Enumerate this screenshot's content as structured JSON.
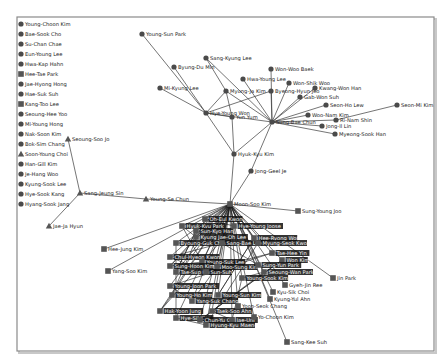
{
  "diagram": {
    "type": "social-network-graph",
    "frame": {
      "x": 17,
      "y": 17,
      "w": 417,
      "h": 334
    }
  },
  "isolated_nodes": [
    {
      "label": "Young-Choon Kim",
      "shape": "circle",
      "x": 21,
      "y": 24
    },
    {
      "label": "Bae-Sook Cho",
      "shape": "circle",
      "x": 21,
      "y": 34
    },
    {
      "label": "Su-Chan Chae",
      "shape": "circle",
      "x": 21,
      "y": 44
    },
    {
      "label": "Eun-Young Lee",
      "shape": "circle",
      "x": 21,
      "y": 54
    },
    {
      "label": "Hwa-Kap Hahn",
      "shape": "circle",
      "x": 21,
      "y": 64
    },
    {
      "label": "Hee-Tae Park",
      "shape": "square",
      "x": 21,
      "y": 74
    },
    {
      "label": "Jae-Hyong Hong",
      "shape": "circle",
      "x": 21,
      "y": 84
    },
    {
      "label": "Hae-Suk Suh",
      "shape": "circle",
      "x": 21,
      "y": 94
    },
    {
      "label": "Kang-Too Lee",
      "shape": "square",
      "x": 21,
      "y": 104
    },
    {
      "label": "Seoung-Hee Yoo",
      "shape": "circle",
      "x": 21,
      "y": 114
    },
    {
      "label": "Mi-Young Hong",
      "shape": "circle",
      "x": 21,
      "y": 124
    },
    {
      "label": "Nak-Soon Kim",
      "shape": "circle",
      "x": 21,
      "y": 134
    },
    {
      "label": "Bok-Sim Chang",
      "shape": "circle",
      "x": 21,
      "y": 144
    },
    {
      "label": "Soon-Young Choi",
      "shape": "triangle",
      "x": 21,
      "y": 154
    },
    {
      "label": "Han-Gill Kim",
      "shape": "circle",
      "x": 21,
      "y": 164
    },
    {
      "label": "Je-Hang Woo",
      "shape": "circle",
      "x": 21,
      "y": 174
    },
    {
      "label": "Kyung-Sook Lee",
      "shape": "circle",
      "x": 21,
      "y": 184
    },
    {
      "label": "Hye-Sook Kang",
      "shape": "circle",
      "x": 21,
      "y": 194
    },
    {
      "label": "Hyang-Sook Jang",
      "shape": "circle",
      "x": 21,
      "y": 204
    }
  ],
  "nodes": [
    {
      "id": "ysp",
      "label": "Young-Sun Park",
      "shape": "circle",
      "x": 142,
      "y": 34
    },
    {
      "id": "skl",
      "label": "Sang-Kyung Lee",
      "shape": "circle",
      "x": 206,
      "y": 58
    },
    {
      "id": "bdm",
      "label": "Byung-Du Min",
      "shape": "circle",
      "x": 174,
      "y": 67
    },
    {
      "id": "wwb",
      "label": "Won-Woo Baek",
      "shape": "circle",
      "x": 271,
      "y": 69
    },
    {
      "id": "hyl",
      "label": "Hwa-Young Lee",
      "shape": "circle",
      "x": 243,
      "y": 79
    },
    {
      "id": "mkl",
      "label": "Mi-Kyung Lee",
      "shape": "circle",
      "x": 160,
      "y": 88
    },
    {
      "id": "wsw",
      "label": "Won-Shik Woo",
      "shape": "circle",
      "x": 289,
      "y": 83
    },
    {
      "id": "kwh",
      "label": "Kwang-Won Han",
      "shape": "circle",
      "x": 315,
      "y": 88
    },
    {
      "id": "mjk",
      "label": "Myung-Ja Kim",
      "shape": "circle",
      "x": 226,
      "y": 91
    },
    {
      "id": "bhj",
      "label": "Byeong-Hyun Jeo",
      "shape": "circle",
      "x": 271,
      "y": 91
    },
    {
      "id": "gws",
      "label": "Gab-Won Suh",
      "shape": "circle",
      "x": 300,
      "y": 97
    },
    {
      "id": "sml",
      "label": "Seon-Ho Lew",
      "shape": "circle",
      "x": 326,
      "y": 105
    },
    {
      "id": "smk",
      "label": "Seon-Mi Kim",
      "shape": "circle",
      "x": 397,
      "y": 105
    },
    {
      "id": "hyw",
      "label": "Hye-Young Won",
      "shape": "circle",
      "x": 206,
      "y": 113
    },
    {
      "id": "yy",
      "label": "Yun Yum",
      "shape": "circle",
      "x": 232,
      "y": 117
    },
    {
      "id": "sbc",
      "label": "Sung-Bae Chun",
      "shape": "circle",
      "x": 272,
      "y": 122
    },
    {
      "id": "wnk",
      "label": "Woo-Nam Kim",
      "shape": "circle",
      "x": 308,
      "y": 115
    },
    {
      "id": "rns",
      "label": "Ri-Nam Shin",
      "shape": "circle",
      "x": 336,
      "y": 120
    },
    {
      "id": "jid",
      "label": "Jong-Il Lin",
      "shape": "circle",
      "x": 322,
      "y": 126
    },
    {
      "id": "msh",
      "label": "Myeong-Sook Han",
      "shape": "circle",
      "x": 335,
      "y": 134
    },
    {
      "id": "hkk",
      "label": "Hyuk-Kyu Kim",
      "shape": "circle",
      "x": 234,
      "y": 154
    },
    {
      "id": "sjj",
      "label": "Seoung-Soo Jo",
      "shape": "triangle",
      "x": 68,
      "y": 139
    },
    {
      "id": "gjj",
      "label": "Jong-Geel Je",
      "shape": "circle",
      "x": 251,
      "y": 171
    },
    {
      "id": "sjs",
      "label": "Sang-Jeung Sin",
      "shape": "triangle",
      "x": 80,
      "y": 193
    },
    {
      "id": "ysc",
      "label": "Young-Se Chun",
      "shape": "triangle",
      "x": 146,
      "y": 199
    },
    {
      "id": "jyh",
      "label": "Jae-Ja Hyun",
      "shape": "triangle",
      "x": 49,
      "y": 226
    },
    {
      "id": "msk",
      "label": "Moon-Soo Kim",
      "shape": "square",
      "x": 230,
      "y": 204
    },
    {
      "id": "syj",
      "label": "Sung-Young Joo",
      "shape": "square",
      "x": 298,
      "y": 211
    },
    {
      "id": "hjk",
      "label": "Hee-Jung Kim",
      "shape": "square",
      "x": 104,
      "y": 249
    },
    {
      "id": "yok",
      "label": "Yang-Soo Kim",
      "shape": "square",
      "x": 108,
      "y": 271
    },
    {
      "id": "jpk",
      "label": "Jin Park",
      "shape": "square",
      "x": 333,
      "y": 278
    },
    {
      "id": "skk",
      "label": "Sang-Kee Suh",
      "shape": "square",
      "x": 287,
      "y": 342
    },
    {
      "id": "gj",
      "label": "Gyeh-Jin Ree",
      "shape": "square",
      "x": 285,
      "y": 285
    },
    {
      "id": "ksc",
      "label": "Kyu-Sik Choi",
      "shape": "square",
      "x": 273,
      "y": 292
    },
    {
      "id": "kya",
      "label": "Kyung-Yul Ahn",
      "shape": "square",
      "x": 270,
      "y": 299
    },
    {
      "id": "yck",
      "label": "Yo-Choon Kim",
      "shape": "square",
      "x": 254,
      "y": 317
    },
    {
      "id": "ysc2",
      "label": "Yoon-Seok Chang",
      "shape": "square",
      "x": 238,
      "y": 306
    }
  ],
  "cluster_labels": [
    {
      "label": "Oh-Eul Kwon",
      "x": 205,
      "y": 219
    },
    {
      "label": "Hyuk-Kyu Park",
      "x": 182,
      "y": 226
    },
    {
      "label": "Sun-Kyo Han",
      "x": 196,
      "y": 231
    },
    {
      "label": "Hye-Young Joose",
      "x": 234,
      "y": 226
    },
    {
      "label": "Kyung Jae-Oh Lee",
      "x": 196,
      "y": 237
    },
    {
      "label": "Byoung-Guk Choung",
      "x": 176,
      "y": 243
    },
    {
      "label": "Sang-Bae Lee",
      "x": 222,
      "y": 243
    },
    {
      "label": "Hee-Ryong Won",
      "x": 254,
      "y": 238
    },
    {
      "label": "Myung-Seok Kwon",
      "x": 258,
      "y": 243
    },
    {
      "label": "Chul-Hyeon Kwon",
      "x": 170,
      "y": 257
    },
    {
      "label": "Young-Suk Lee",
      "x": 202,
      "y": 262
    },
    {
      "label": "Tae-Hee Yin",
      "x": 272,
      "y": 253
    },
    {
      "label": "Won Kim",
      "x": 282,
      "y": 260
    },
    {
      "label": "Sung-Hoon Kim",
      "x": 170,
      "y": 266
    },
    {
      "label": "Moo-Sung Kim",
      "x": 217,
      "y": 267
    },
    {
      "label": "Sung-Yun Park",
      "x": 258,
      "y": 265
    },
    {
      "label": "Seoung-Wan Park",
      "x": 264,
      "y": 272
    },
    {
      "label": "Tae-Sup Kang",
      "x": 176,
      "y": 272
    },
    {
      "label": "Sun-Suh",
      "x": 206,
      "y": 272
    },
    {
      "label": "Young-Sook Kim",
      "x": 242,
      "y": 278
    },
    {
      "label": "Young-Joon Park",
      "x": 170,
      "y": 286
    },
    {
      "label": "Young-Ho Kim",
      "x": 172,
      "y": 295
    },
    {
      "label": "Young-Sun Kim",
      "x": 218,
      "y": 295
    },
    {
      "label": "Yang-Suk Chang",
      "x": 192,
      "y": 301
    },
    {
      "label": "Hak-Yoon Jung",
      "x": 160,
      "y": 311
    },
    {
      "label": "Taek-Soo Ahn",
      "x": 212,
      "y": 311
    },
    {
      "label": "Hye-Sil Kim",
      "x": 176,
      "y": 318
    },
    {
      "label": "Chun-Yu Oh",
      "x": 200,
      "y": 320
    },
    {
      "label": "Jae-Uni",
      "x": 232,
      "y": 320
    },
    {
      "label": "Hyung-Kyu Maeng",
      "x": 206,
      "y": 325
    }
  ],
  "edges": [
    [
      "ysp",
      "hyw"
    ],
    [
      "bdm",
      "hyw"
    ],
    [
      "skl",
      "mjk"
    ],
    [
      "skl",
      "sbc"
    ],
    [
      "mkl",
      "hyw"
    ],
    [
      "hyl",
      "sbc"
    ],
    [
      "wwb",
      "sbc"
    ],
    [
      "mjk",
      "hyw"
    ],
    [
      "mjk",
      "yy"
    ],
    [
      "mjk",
      "sbc"
    ],
    [
      "bhj",
      "sbc"
    ],
    [
      "bhj",
      "hyw"
    ],
    [
      "wsw",
      "sbc"
    ],
    [
      "kwh",
      "sbc"
    ],
    [
      "gws",
      "sbc"
    ],
    [
      "sml",
      "sbc"
    ],
    [
      "smk",
      "rns"
    ],
    [
      "wnk",
      "sbc"
    ],
    [
      "rns",
      "sbc"
    ],
    [
      "jid",
      "sbc"
    ],
    [
      "msh",
      "sbc"
    ],
    [
      "hyw",
      "yy"
    ],
    [
      "hyw",
      "sbc"
    ],
    [
      "hyw",
      "hkk"
    ],
    [
      "yy",
      "hkk"
    ],
    [
      "sbc",
      "hkk"
    ],
    [
      "hkk",
      "msk"
    ],
    [
      "gjj",
      "sbc"
    ],
    [
      "gjj",
      "msk"
    ],
    [
      "sjj",
      "sjs"
    ],
    [
      "jyh",
      "sjs"
    ],
    [
      "sjs",
      "ysc"
    ],
    [
      "ysc",
      "msk"
    ],
    [
      "syj",
      "msk"
    ],
    [
      "hjk",
      "msk"
    ],
    [
      "yok",
      "msk"
    ],
    [
      "jpk",
      "msk"
    ],
    [
      "skk",
      "msk"
    ],
    [
      "gj",
      "msk"
    ],
    [
      "ksc",
      "msk"
    ],
    [
      "kya",
      "msk"
    ],
    [
      "yck",
      "msk"
    ],
    [
      "ysc2",
      "msk"
    ]
  ]
}
